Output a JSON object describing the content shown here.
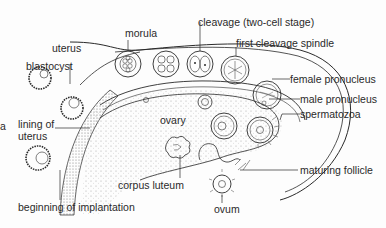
{
  "diagram": {
    "type": "biological-illustration",
    "labels": {
      "uterus": "uterus",
      "blastocyst": "blastocyst",
      "morula": "morula",
      "cleavage": "cleavage (two-cell stage)",
      "first_cleavage_spindle": "first cleavage spindle",
      "female_pronucleus": "female pronucleus",
      "male_pronucleus": "male pronucleus",
      "spermatozoa": "spermatozoa",
      "lining_of_uterus": "lining of uterus",
      "lining_line1": "lining of",
      "lining_line2": "uterus",
      "ovary": "ovary",
      "corpus_luteum": "corpus luteum",
      "maturing_follicle": "maturing follicle",
      "ovum": "ovum",
      "beginning_of_implantation": "beginning of implantation",
      "edge_fragment": "a"
    },
    "colors": {
      "ink": "#2a2a2a",
      "background": "#fdfdfd",
      "stipple": "#9a9a9a"
    }
  }
}
